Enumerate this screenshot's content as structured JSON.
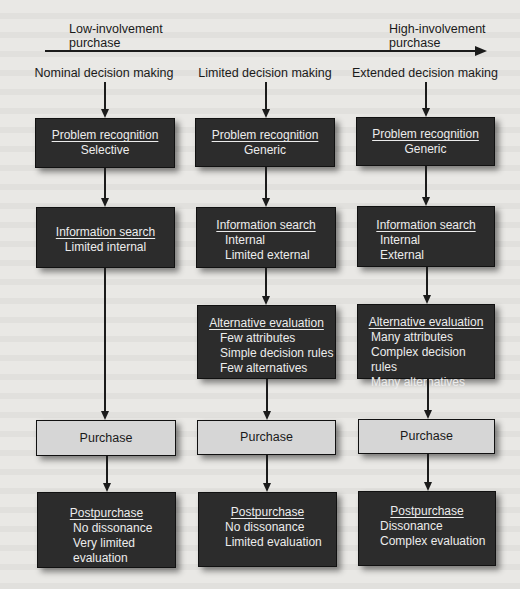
{
  "axis": {
    "low_label_line1": "Low-involvement",
    "low_label_line2": "purchase",
    "high_label_line1": "High-involvement",
    "high_label_line2": "purchase"
  },
  "columns": [
    {
      "title": "Nominal decision making",
      "problem_recognition": {
        "title": "Problem recognition",
        "detail": "Selective"
      },
      "information_search": {
        "title": "Information search",
        "lines": [
          "Limited internal"
        ]
      },
      "alternative_evaluation": null,
      "purchase": {
        "label": "Purchase"
      },
      "postpurchase": {
        "title": "Postpurchase",
        "lines": [
          "No dissonance",
          "Very limited",
          "evaluation"
        ]
      }
    },
    {
      "title": "Limited decision making",
      "problem_recognition": {
        "title": "Problem recognition",
        "detail": "Generic"
      },
      "information_search": {
        "title": "Information search",
        "lines": [
          "Internal",
          "Limited external"
        ]
      },
      "alternative_evaluation": {
        "title": "Alternative evaluation",
        "lines": [
          "Few attributes",
          "Simple decision rules",
          "Few alternatives"
        ]
      },
      "purchase": {
        "label": "Purchase"
      },
      "postpurchase": {
        "title": "Postpurchase",
        "lines": [
          "No dissonance",
          "Limited evaluation"
        ]
      }
    },
    {
      "title": "Extended decision making",
      "problem_recognition": {
        "title": "Problem recognition",
        "detail": "Generic"
      },
      "information_search": {
        "title": "Information search",
        "lines": [
          "Internal",
          "External"
        ]
      },
      "alternative_evaluation": {
        "title": "Alternative evaluation",
        "lines": [
          "Many attributes",
          "Complex decision rules",
          "Many alternatives"
        ]
      },
      "purchase": {
        "label": "Purchase"
      },
      "postpurchase": {
        "title": "Postpurchase",
        "lines": [
          "Dissonance",
          "Complex evaluation"
        ]
      }
    }
  ],
  "colors": {
    "dark_box": "#2c2c2c",
    "light_box": "#d6d6d6",
    "background": "#e9e8e5",
    "line": "#1b1b1b"
  }
}
